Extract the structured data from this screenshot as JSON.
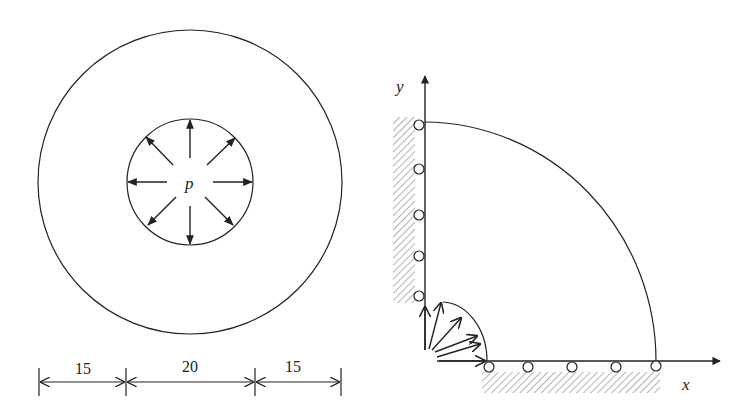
{
  "left_figure": {
    "description": "Thick-walled cylinder cross-section under internal pressure",
    "pressure_label": "p",
    "dimensions": [
      {
        "label": "15",
        "segment": "outer wall left"
      },
      {
        "label": "20",
        "segment": "inner bore diameter"
      },
      {
        "label": "15",
        "segment": "outer wall right"
      }
    ]
  },
  "right_figure": {
    "description": "Quarter model with roller supports on symmetry boundaries and internal pressure",
    "axis_x_label": "x",
    "axis_y_label": "y",
    "rollers_on_y_axis": 5,
    "rollers_on_x_axis": 5,
    "pressure_arrows": 6
  },
  "colors": {
    "line": "#222222",
    "hatch": "#888888",
    "background": "#ffffff"
  }
}
